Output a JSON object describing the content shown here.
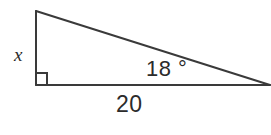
{
  "figure": {
    "type": "right-triangle-diagram",
    "background_color": "#ffffff",
    "stroke_color": "#3a3a3a",
    "text_color": "#2b2b2b",
    "stroke_width": 2,
    "width": 271,
    "height": 135
  },
  "labels": {
    "opposite_side": "x",
    "angle": "18 °",
    "adjacent_side": "20"
  },
  "geometry": {
    "vertices": {
      "top_left": {
        "x": 36,
        "y": 11
      },
      "bottom_left": {
        "x": 36,
        "y": 85
      },
      "right": {
        "x": 270,
        "y": 85
      }
    },
    "right_angle_marker": {
      "at_vertex": "bottom_left",
      "size": 11
    },
    "angle_measure_degrees": 18,
    "adjacent_side_length": 20,
    "opposite_side_length": "x"
  }
}
